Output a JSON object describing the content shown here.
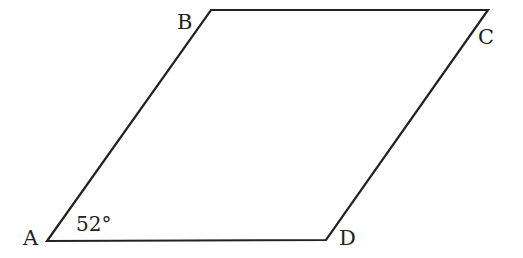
{
  "figure": {
    "type": "parallelogram",
    "stroke_color": "#222222",
    "vertices": [
      {
        "name": "A",
        "label": "A",
        "x": 47,
        "y": 241,
        "label_x": 23,
        "label_y": 245
      },
      {
        "name": "B",
        "label": "B",
        "x": 211,
        "y": 10,
        "label_x": 177,
        "label_y": 29
      },
      {
        "name": "C",
        "label": "C",
        "x": 488,
        "y": 10,
        "label_x": 478,
        "label_y": 44
      },
      {
        "name": "D",
        "label": "D",
        "x": 326,
        "y": 240,
        "label_x": 339,
        "label_y": 245
      }
    ],
    "angle": {
      "vertex": "A",
      "label": "52°",
      "x": 76,
      "y": 231
    }
  }
}
